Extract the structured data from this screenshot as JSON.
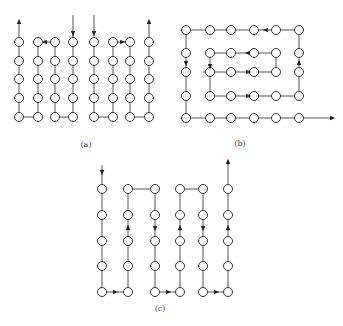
{
  "colors": {
    "line": "#555555",
    "node_stroke": "#333333",
    "arrow": "#222222",
    "background": "#ffffff"
  },
  "node_radius": 4.5,
  "diagrams": [
    {
      "id": "a",
      "label": "(a)",
      "label_pos": [
        86,
        146
      ],
      "description": "Serpentine column scans: four separate paths each covering two columns",
      "nodes_cols": [
        19,
        38,
        55,
        73,
        94,
        113,
        130,
        149
      ],
      "nodes_rows": [
        42,
        61,
        79,
        98,
        117
      ],
      "edges": [
        [
          [
            19,
            42
          ],
          [
            19,
            117
          ]
        ],
        [
          [
            19,
            117
          ],
          [
            38,
            117
          ]
        ],
        [
          [
            38,
            117
          ],
          [
            38,
            42
          ]
        ],
        [
          [
            55,
            42
          ],
          [
            55,
            117
          ]
        ],
        [
          [
            55,
            117
          ],
          [
            73,
            117
          ]
        ],
        [
          [
            73,
            117
          ],
          [
            73,
            42
          ]
        ],
        [
          [
            94,
            42
          ],
          [
            94,
            117
          ]
        ],
        [
          [
            94,
            117
          ],
          [
            113,
            117
          ]
        ],
        [
          [
            113,
            117
          ],
          [
            113,
            42
          ]
        ],
        [
          [
            130,
            42
          ],
          [
            130,
            117
          ]
        ],
        [
          [
            130,
            117
          ],
          [
            149,
            117
          ]
        ],
        [
          [
            149,
            117
          ],
          [
            149,
            42
          ]
        ],
        [
          [
            19,
            37
          ],
          [
            19,
            23
          ]
        ],
        [
          [
            73,
            15
          ],
          [
            73,
            37
          ]
        ],
        [
          [
            94,
            15
          ],
          [
            94,
            37
          ]
        ],
        [
          [
            149,
            37
          ],
          [
            149,
            23
          ]
        ]
      ],
      "arrows": [
        {
          "at": [
            19,
            22
          ],
          "dir": "up"
        },
        {
          "at": [
            73,
            33
          ],
          "dir": "down"
        },
        {
          "at": [
            94,
            33
          ],
          "dir": "down"
        },
        {
          "at": [
            149,
            22
          ],
          "dir": "up"
        },
        {
          "at": [
            45,
            42
          ],
          "dir": "left"
        },
        {
          "at": [
            122,
            42
          ],
          "dir": "right"
        }
      ],
      "extra_edges": [
        [
          [
            38,
            42
          ],
          [
            55,
            42
          ]
        ],
        [
          [
            113,
            42
          ],
          [
            130,
            42
          ]
        ]
      ]
    },
    {
      "id": "b",
      "label": "(b)",
      "label_pos": [
        240,
        145
      ],
      "description": "Spiral scan inward then outward exiting right",
      "nodes": [
        [
          186,
          30
        ],
        [
          210,
          30
        ],
        [
          231,
          30
        ],
        [
          254,
          30
        ],
        [
          276,
          30
        ],
        [
          299,
          30
        ],
        [
          186,
          53
        ],
        [
          210,
          53
        ],
        [
          231,
          53
        ],
        [
          254,
          53
        ],
        [
          276,
          53
        ],
        [
          299,
          53
        ],
        [
          186,
          72
        ],
        [
          210,
          72
        ],
        [
          231,
          72
        ],
        [
          254,
          72
        ],
        [
          276,
          72
        ],
        [
          299,
          72
        ],
        [
          186,
          96
        ],
        [
          210,
          96
        ],
        [
          231,
          96
        ],
        [
          254,
          96
        ],
        [
          276,
          96
        ],
        [
          299,
          96
        ],
        [
          186,
          118
        ],
        [
          210,
          118
        ],
        [
          231,
          118
        ],
        [
          254,
          118
        ],
        [
          276,
          118
        ],
        [
          299,
          118
        ]
      ],
      "edges": [
        [
          [
            203,
            72
          ],
          [
            276,
            72
          ]
        ],
        [
          [
            276,
            72
          ],
          [
            276,
            53
          ]
        ],
        [
          [
            276,
            53
          ],
          [
            210,
            53
          ]
        ],
        [
          [
            210,
            53
          ],
          [
            210,
            96
          ]
        ],
        [
          [
            210,
            96
          ],
          [
            299,
            96
          ]
        ],
        [
          [
            299,
            96
          ],
          [
            299,
            30
          ]
        ],
        [
          [
            299,
            30
          ],
          [
            186,
            30
          ]
        ],
        [
          [
            186,
            30
          ],
          [
            186,
            118
          ]
        ],
        [
          [
            186,
            118
          ],
          [
            330,
            118
          ]
        ]
      ],
      "arrows": [
        {
          "at": [
            248,
            72
          ],
          "dir": "right"
        },
        {
          "at": [
            248,
            53
          ],
          "dir": "left"
        },
        {
          "at": [
            210,
            66
          ],
          "dir": "down"
        },
        {
          "at": [
            248,
            96
          ],
          "dir": "right"
        },
        {
          "at": [
            299,
            63
          ],
          "dir": "up"
        },
        {
          "at": [
            266,
            30
          ],
          "dir": "left"
        },
        {
          "at": [
            186,
            63
          ],
          "dir": "down"
        },
        {
          "at": [
            332,
            118
          ],
          "dir": "right"
        }
      ]
    },
    {
      "id": "c",
      "label": "(c)",
      "label_pos": [
        160,
        310
      ],
      "description": "Single continuous boustrophedon column scan",
      "nodes_cols": [
        102,
        128,
        155,
        180,
        203,
        228
      ],
      "nodes_rows": [
        189,
        215,
        241,
        266,
        292
      ],
      "edges": [
        [
          [
            102,
            165
          ],
          [
            102,
            292
          ]
        ],
        [
          [
            102,
            292
          ],
          [
            128,
            292
          ]
        ],
        [
          [
            128,
            292
          ],
          [
            128,
            189
          ]
        ],
        [
          [
            128,
            189
          ],
          [
            155,
            189
          ]
        ],
        [
          [
            155,
            189
          ],
          [
            155,
            292
          ]
        ],
        [
          [
            155,
            292
          ],
          [
            180,
            292
          ]
        ],
        [
          [
            180,
            292
          ],
          [
            180,
            189
          ]
        ],
        [
          [
            180,
            189
          ],
          [
            203,
            189
          ]
        ],
        [
          [
            203,
            189
          ],
          [
            203,
            292
          ]
        ],
        [
          [
            203,
            292
          ],
          [
            228,
            292
          ]
        ],
        [
          [
            228,
            292
          ],
          [
            228,
            160
          ]
        ]
      ],
      "arrows": [
        {
          "at": [
            102,
            172
          ],
          "dir": "down"
        },
        {
          "at": [
            115,
            292
          ],
          "dir": "right"
        },
        {
          "at": [
            128,
            228
          ],
          "dir": "up"
        },
        {
          "at": [
            155,
            228
          ],
          "dir": "down"
        },
        {
          "at": [
            168,
            292
          ],
          "dir": "right"
        },
        {
          "at": [
            180,
            228
          ],
          "dir": "up"
        },
        {
          "at": [
            203,
            228
          ],
          "dir": "down"
        },
        {
          "at": [
            216,
            292
          ],
          "dir": "right"
        },
        {
          "at": [
            228,
            228
          ],
          "dir": "up"
        },
        {
          "at": [
            228,
            162
          ],
          "dir": "up"
        }
      ]
    }
  ]
}
